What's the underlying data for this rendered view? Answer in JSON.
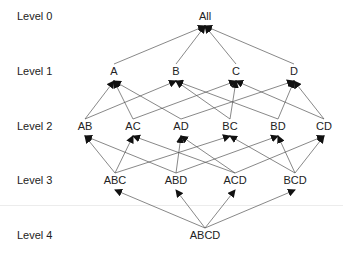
{
  "diagram": {
    "title": "",
    "levels": [
      {
        "label": "Level 0",
        "y": 17
      },
      {
        "label": "Level 1",
        "y": 72
      },
      {
        "label": "Level 2",
        "y": 127
      },
      {
        "label": "Level 3",
        "y": 181
      },
      {
        "label": "Level 4",
        "y": 236
      }
    ],
    "nodes": [
      {
        "id": "All",
        "label": "All",
        "level": 0,
        "x": 205
      },
      {
        "id": "A",
        "label": "A",
        "level": 1,
        "x": 114
      },
      {
        "id": "B",
        "label": "B",
        "level": 1,
        "x": 176
      },
      {
        "id": "C",
        "label": "C",
        "level": 1,
        "x": 236
      },
      {
        "id": "D",
        "label": "D",
        "level": 1,
        "x": 294
      },
      {
        "id": "AB",
        "label": "AB",
        "level": 2,
        "x": 85
      },
      {
        "id": "AC",
        "label": "AC",
        "level": 2,
        "x": 133
      },
      {
        "id": "AD",
        "label": "AD",
        "level": 2,
        "x": 181
      },
      {
        "id": "BC",
        "label": "BC",
        "level": 2,
        "x": 230
      },
      {
        "id": "BD",
        "label": "BD",
        "level": 2,
        "x": 278
      },
      {
        "id": "CD",
        "label": "CD",
        "level": 2,
        "x": 324
      },
      {
        "id": "ABC",
        "label": "ABC",
        "level": 3,
        "x": 115
      },
      {
        "id": "ABD",
        "label": "ABD",
        "level": 3,
        "x": 176
      },
      {
        "id": "ACD",
        "label": "ACD",
        "level": 3,
        "x": 235
      },
      {
        "id": "BCD",
        "label": "BCD",
        "level": 3,
        "x": 295
      },
      {
        "id": "ABCD",
        "label": "ABCD",
        "level": 4,
        "x": 205
      }
    ],
    "edges": [
      [
        "A",
        "All"
      ],
      [
        "B",
        "All"
      ],
      [
        "C",
        "All"
      ],
      [
        "D",
        "All"
      ],
      [
        "AB",
        "A"
      ],
      [
        "AB",
        "B"
      ],
      [
        "AC",
        "A"
      ],
      [
        "AC",
        "C"
      ],
      [
        "AD",
        "A"
      ],
      [
        "AD",
        "D"
      ],
      [
        "BC",
        "B"
      ],
      [
        "BC",
        "C"
      ],
      [
        "BD",
        "B"
      ],
      [
        "BD",
        "D"
      ],
      [
        "CD",
        "C"
      ],
      [
        "CD",
        "D"
      ],
      [
        "ABC",
        "AB"
      ],
      [
        "ABC",
        "AC"
      ],
      [
        "ABC",
        "BC"
      ],
      [
        "ABD",
        "AB"
      ],
      [
        "ABD",
        "AD"
      ],
      [
        "ABD",
        "BD"
      ],
      [
        "ACD",
        "AC"
      ],
      [
        "ACD",
        "AD"
      ],
      [
        "ACD",
        "CD"
      ],
      [
        "BCD",
        "BC"
      ],
      [
        "BCD",
        "BD"
      ],
      [
        "BCD",
        "CD"
      ],
      [
        "ABCD",
        "ABC"
      ],
      [
        "ABCD",
        "ABD"
      ],
      [
        "ABCD",
        "ACD"
      ],
      [
        "ABCD",
        "BCD"
      ]
    ],
    "colors": {
      "line": "#555555",
      "arrow": "#111111",
      "text": "#222222"
    }
  }
}
